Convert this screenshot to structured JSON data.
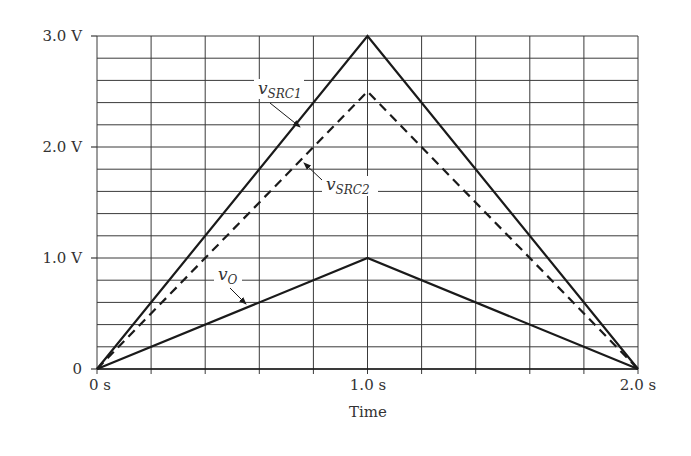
{
  "chart_data": {
    "type": "line",
    "title": "",
    "xlabel": "Time",
    "ylabel": "",
    "xlim": [
      0,
      2.0
    ],
    "ylim": [
      0,
      3.0
    ],
    "grid": true,
    "x_grid_divisions": 10,
    "y_grid_divisions": 15,
    "x_ticks": [
      {
        "value": 0,
        "label": "0 s"
      },
      {
        "value": 1.0,
        "label": "1.0 s"
      },
      {
        "value": 2.0,
        "label": "2.0 s"
      }
    ],
    "y_ticks": [
      {
        "value": 0,
        "label": "0"
      },
      {
        "value": 1.0,
        "label": "1.0 V"
      },
      {
        "value": 2.0,
        "label": "2.0 V"
      },
      {
        "value": 3.0,
        "label": "3.0 V"
      }
    ],
    "x": [
      0,
      1.0,
      2.0
    ],
    "series": [
      {
        "name": "vSRC1",
        "label_main": "v",
        "label_sub": "SRC1",
        "style": "solid",
        "values": [
          0,
          3.0,
          0
        ]
      },
      {
        "name": "vSRC2",
        "label_main": "v",
        "label_sub": "SRC2",
        "style": "dashed",
        "values": [
          0,
          2.5,
          0
        ]
      },
      {
        "name": "vO",
        "label_main": "v",
        "label_sub": "O",
        "style": "solid",
        "values": [
          0,
          1.0,
          0
        ]
      }
    ],
    "legend": "inline annotations with arrows"
  },
  "colors": {
    "line": "#1a1a1a",
    "grid": "#3a3a3a",
    "background": "#ffffff"
  }
}
